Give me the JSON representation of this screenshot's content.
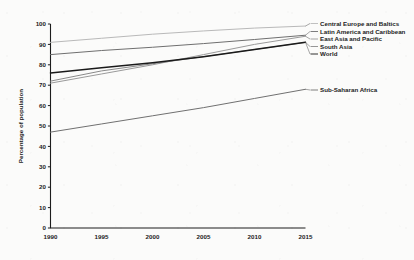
{
  "figure": {
    "title_partial": "",
    "y_axis_title": "Percentage of population"
  },
  "chart_data": {
    "type": "line",
    "title": "",
    "xlabel": "",
    "ylabel": "Percentage of population",
    "xlim": [
      1990,
      2015
    ],
    "ylim": [
      0,
      100
    ],
    "grid": false,
    "legend_position": "right-inline-labels",
    "x": [
      1990,
      1995,
      2000,
      2005,
      2010,
      2015
    ],
    "xtick_labels": [
      "1990",
      "1995",
      "2000",
      "2005",
      "2010",
      "2015"
    ],
    "ytick_labels": [
      "0",
      "10",
      "20",
      "30",
      "40",
      "50",
      "60",
      "70",
      "80",
      "90",
      "100"
    ],
    "ytick_values": [
      0,
      10,
      20,
      30,
      40,
      50,
      60,
      70,
      80,
      90,
      100
    ],
    "series": [
      {
        "name": "Central Europe and Baltics",
        "color": "#b9b9b9",
        "width": 1.0,
        "values": [
          91.0,
          93.0,
          95.0,
          96.6,
          98.0,
          99.0
        ]
      },
      {
        "name": "Latin America and Caribbean",
        "color": "#6f6f6f",
        "width": 1.0,
        "values": [
          85.0,
          87.0,
          88.6,
          90.4,
          92.4,
          94.5
        ]
      },
      {
        "name": "East Asia and Pacific",
        "color": "#9a9a9a",
        "width": 1.0,
        "values": [
          71.0,
          75.5,
          80.0,
          85.0,
          90.0,
          94.0
        ]
      },
      {
        "name": "South Asia",
        "color": "#8a8a8a",
        "width": 1.0,
        "values": [
          72.0,
          77.0,
          80.5,
          84.0,
          87.5,
          91.0
        ]
      },
      {
        "name": "World",
        "color": "#1a1a1a",
        "width": 1.5,
        "values": [
          76.0,
          78.5,
          81.0,
          84.0,
          87.5,
          91.0
        ]
      },
      {
        "name": "Sub-Saharan Africa",
        "color": "#707070",
        "width": 1.0,
        "values": [
          47.0,
          51.0,
          55.0,
          59.0,
          63.5,
          68.0
        ]
      }
    ]
  },
  "legend_labels": [
    {
      "text": "Central Europe and Baltics"
    },
    {
      "text": "Latin America and Caribbean"
    },
    {
      "text": "East Asia and Pacific"
    },
    {
      "text": "South Asia"
    },
    {
      "text": "World"
    },
    {
      "text": "Sub-Saharan Africa"
    }
  ]
}
